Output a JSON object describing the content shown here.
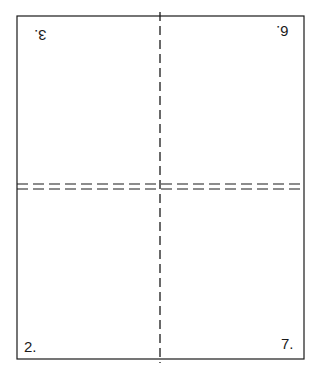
{
  "diagram": {
    "type": "page-imposition-fold-diagram",
    "panels": [
      {
        "position": "top-left",
        "label": "3.",
        "rotated": true
      },
      {
        "position": "top-right",
        "label": "6.",
        "rotated": true
      },
      {
        "position": "bottom-left",
        "label": "2.",
        "rotated": false
      },
      {
        "position": "bottom-right",
        "label": "7.",
        "rotated": false
      }
    ],
    "fold_lines": {
      "vertical": "dashed center fold",
      "horizontal": "double dashed center fold"
    },
    "colors": {
      "line": "#1a1a1a",
      "background": "#ffffff"
    }
  }
}
